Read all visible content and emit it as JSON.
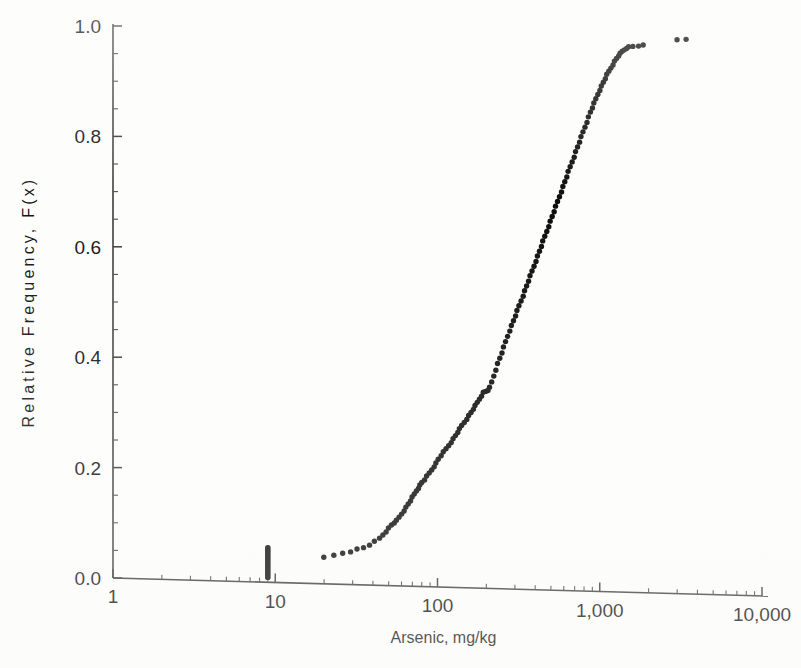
{
  "figure": {
    "background_color": "#fdfdfc",
    "ink_color": "#0d0d0d",
    "axis_color": "#3b3b3b"
  },
  "chart_data": {
    "type": "scatter",
    "title": "",
    "subtitle": "",
    "xlabel": "Arsenic, mg/kg",
    "ylabel": "Relative Frequency, F(x)",
    "xscale": "log",
    "yscale": "linear",
    "xlim": [
      1,
      10000
    ],
    "ylim": [
      0.0,
      1.0
    ],
    "grid": false,
    "legend": "none",
    "x_tick_labels": [
      "1",
      "10",
      "100",
      "1,000",
      "10,000"
    ],
    "x_tick_values": [
      1,
      10,
      100,
      1000,
      10000
    ],
    "x_minor_multipliers": [
      2,
      3,
      4,
      5,
      6,
      7,
      8,
      9
    ],
    "y_tick_labels": [
      "0.0",
      "0.2",
      "0.4",
      "0.6",
      "0.8",
      "1.0"
    ],
    "y_tick_values": [
      0.0,
      0.2,
      0.4,
      0.6,
      0.8,
      1.0
    ],
    "y_minor_step": 0.05,
    "marker": "filled-circle",
    "marker_size_px": 5,
    "annotations": [
      "Vertical stack of coincident non-detect values at approximately 9 mg/kg spanning F(x) = 0.00 to 0.055",
      "Curve flattens near F(x) = 0.96 above 1,500 mg/kg",
      "Two isolated upper-tail points near 3,000-3,500 mg/kg at F(x) = 0.975"
    ],
    "series": [
      {
        "name": "Censored non-detects at 9 mg/kg",
        "x": [
          9,
          9,
          9,
          9,
          9,
          9,
          9,
          9,
          9,
          9,
          9,
          9,
          9,
          9,
          9,
          9,
          9,
          9,
          9,
          9
        ],
        "y": [
          0.001,
          0.004,
          0.007,
          0.01,
          0.013,
          0.016,
          0.019,
          0.022,
          0.025,
          0.028,
          0.031,
          0.034,
          0.037,
          0.04,
          0.043,
          0.046,
          0.049,
          0.051,
          0.053,
          0.055
        ]
      },
      {
        "name": "Detected arsenic concentrations",
        "x": [
          20,
          23,
          26,
          29,
          32,
          35,
          38,
          41,
          44,
          46,
          48,
          50,
          52,
          54,
          56,
          58,
          60,
          62,
          64,
          66,
          68,
          70,
          72,
          74,
          76,
          78,
          80,
          83,
          86,
          89,
          92,
          95,
          98,
          101,
          105,
          109,
          113,
          117,
          121,
          125,
          129,
          133,
          137,
          141,
          146,
          151,
          156,
          161,
          166,
          171,
          176,
          181,
          186,
          192,
          198,
          204,
          210,
          216,
          222,
          228,
          235,
          242,
          249,
          256,
          263,
          270,
          278,
          286,
          294,
          302,
          310,
          318,
          327,
          336,
          345,
          354,
          363,
          373,
          383,
          393,
          403,
          414,
          425,
          436,
          447,
          459,
          471,
          483,
          496,
          509,
          522,
          536,
          550,
          564,
          579,
          594,
          609,
          625,
          641,
          658,
          675,
          693,
          711,
          730,
          749,
          769,
          789,
          810,
          831,
          853,
          876,
          899,
          923,
          947,
          972,
          998,
          1025,
          1052,
          1080,
          1109,
          1139,
          1170,
          1202,
          1235,
          1269,
          1304,
          1340,
          1377,
          1416,
          1456,
          1510,
          1600,
          1730,
          1860,
          3000,
          3400
        ],
        "y": [
          0.037,
          0.041,
          0.045,
          0.048,
          0.052,
          0.055,
          0.06,
          0.066,
          0.072,
          0.078,
          0.084,
          0.09,
          0.096,
          0.1,
          0.104,
          0.11,
          0.116,
          0.122,
          0.128,
          0.134,
          0.14,
          0.146,
          0.152,
          0.158,
          0.163,
          0.168,
          0.173,
          0.178,
          0.184,
          0.19,
          0.196,
          0.202,
          0.208,
          0.215,
          0.222,
          0.228,
          0.234,
          0.24,
          0.246,
          0.252,
          0.258,
          0.264,
          0.27,
          0.276,
          0.282,
          0.288,
          0.294,
          0.3,
          0.306,
          0.312,
          0.318,
          0.324,
          0.33,
          0.336,
          0.338,
          0.34,
          0.345,
          0.355,
          0.366,
          0.377,
          0.388,
          0.398,
          0.408,
          0.418,
          0.428,
          0.438,
          0.448,
          0.457,
          0.466,
          0.475,
          0.484,
          0.493,
          0.502,
          0.511,
          0.52,
          0.529,
          0.538,
          0.547,
          0.556,
          0.565,
          0.574,
          0.583,
          0.592,
          0.601,
          0.61,
          0.619,
          0.628,
          0.637,
          0.646,
          0.655,
          0.664,
          0.673,
          0.682,
          0.691,
          0.7,
          0.709,
          0.718,
          0.727,
          0.736,
          0.745,
          0.754,
          0.763,
          0.772,
          0.781,
          0.79,
          0.799,
          0.808,
          0.817,
          0.826,
          0.835,
          0.844,
          0.852,
          0.86,
          0.868,
          0.876,
          0.884,
          0.891,
          0.898,
          0.905,
          0.912,
          0.918,
          0.924,
          0.93,
          0.936,
          0.941,
          0.946,
          0.95,
          0.954,
          0.957,
          0.96,
          0.962,
          0.963,
          0.964,
          0.965,
          0.975,
          0.976
        ]
      }
    ]
  }
}
